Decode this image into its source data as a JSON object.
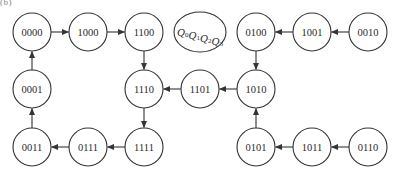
{
  "caption_fragment": "(b)",
  "diagram": {
    "type": "state-transition-diagram",
    "legend": {
      "label": "Q0Q1Q2Q3",
      "variables": [
        {
          "base": "Q",
          "sub": "0"
        },
        {
          "base": "Q",
          "sub": "1"
        },
        {
          "base": "Q",
          "sub": "2"
        },
        {
          "base": "Q",
          "sub": "3"
        }
      ],
      "cx": 200,
      "cy": 32,
      "rx": 26,
      "ry": 20
    },
    "node_radius": 19,
    "nodes": [
      {
        "id": "0000",
        "label": "0000",
        "cx": 32,
        "cy": 32
      },
      {
        "id": "1000",
        "label": "1000",
        "cx": 88,
        "cy": 32
      },
      {
        "id": "1100",
        "label": "1100",
        "cx": 144,
        "cy": 32
      },
      {
        "id": "0100",
        "label": "0100",
        "cx": 256,
        "cy": 32
      },
      {
        "id": "1001",
        "label": "1001",
        "cx": 312,
        "cy": 32
      },
      {
        "id": "0010",
        "label": "0010",
        "cx": 368,
        "cy": 32
      },
      {
        "id": "0001",
        "label": "0001",
        "cx": 32,
        "cy": 89
      },
      {
        "id": "1110",
        "label": "1110",
        "cx": 144,
        "cy": 89
      },
      {
        "id": "1101",
        "label": "1101",
        "cx": 200,
        "cy": 89
      },
      {
        "id": "1010",
        "label": "1010",
        "cx": 256,
        "cy": 89
      },
      {
        "id": "0011",
        "label": "0011",
        "cx": 32,
        "cy": 147
      },
      {
        "id": "0111",
        "label": "0111",
        "cx": 88,
        "cy": 147
      },
      {
        "id": "1111",
        "label": "1111",
        "cx": 144,
        "cy": 147
      },
      {
        "id": "0101",
        "label": "0101",
        "cx": 256,
        "cy": 147
      },
      {
        "id": "1011",
        "label": "1011",
        "cx": 312,
        "cy": 147
      },
      {
        "id": "0110",
        "label": "0110",
        "cx": 368,
        "cy": 147
      }
    ],
    "edges": [
      {
        "from": "0000",
        "to": "1000"
      },
      {
        "from": "1000",
        "to": "1100"
      },
      {
        "from": "1100",
        "to": "1110"
      },
      {
        "from": "1110",
        "to": "1111"
      },
      {
        "from": "1111",
        "to": "0111"
      },
      {
        "from": "0111",
        "to": "0011"
      },
      {
        "from": "0011",
        "to": "0001"
      },
      {
        "from": "0001",
        "to": "0000"
      },
      {
        "from": "1101",
        "to": "1110"
      },
      {
        "from": "1010",
        "to": "1101"
      },
      {
        "from": "0100",
        "to": "1010"
      },
      {
        "from": "1001",
        "to": "0100"
      },
      {
        "from": "0010",
        "to": "1001"
      },
      {
        "from": "0101",
        "to": "1010"
      },
      {
        "from": "1011",
        "to": "0101"
      },
      {
        "from": "0110",
        "to": "1011"
      }
    ],
    "colors": {
      "stroke": "#333333",
      "text": "#2a2a2a",
      "background": "#ffffff"
    }
  }
}
